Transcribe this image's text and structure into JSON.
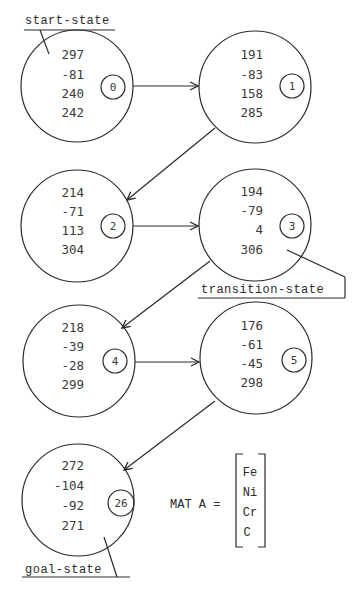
{
  "diagram": {
    "labels": {
      "start": "start-state",
      "transition": "transition-state",
      "goal": "goal-state"
    },
    "states": [
      {
        "index": "0",
        "values": [
          "297",
          "-81",
          "240",
          "242"
        ]
      },
      {
        "index": "1",
        "values": [
          "191",
          "-83",
          "158",
          "285"
        ]
      },
      {
        "index": "2",
        "values": [
          "214",
          "-71",
          "113",
          "304"
        ]
      },
      {
        "index": "3",
        "values": [
          "194",
          "-79",
          "4",
          "306"
        ]
      },
      {
        "index": "4",
        "values": [
          "218",
          "-39",
          "-28",
          "299"
        ]
      },
      {
        "index": "5",
        "values": [
          "176",
          "-61",
          "-45",
          "298"
        ]
      },
      {
        "index": "26",
        "values": [
          "272",
          "-104",
          "-92",
          "271"
        ]
      }
    ],
    "edges": [
      {
        "from": "0",
        "to": "1"
      },
      {
        "from": "1",
        "to": "2"
      },
      {
        "from": "2",
        "to": "3"
      },
      {
        "from": "3",
        "to": "4"
      },
      {
        "from": "4",
        "to": "5"
      },
      {
        "from": "5",
        "to": "26"
      }
    ],
    "matrix": {
      "label": "MAT A =",
      "elements": [
        "Fe",
        "Ni",
        "Cr",
        "C"
      ]
    }
  }
}
